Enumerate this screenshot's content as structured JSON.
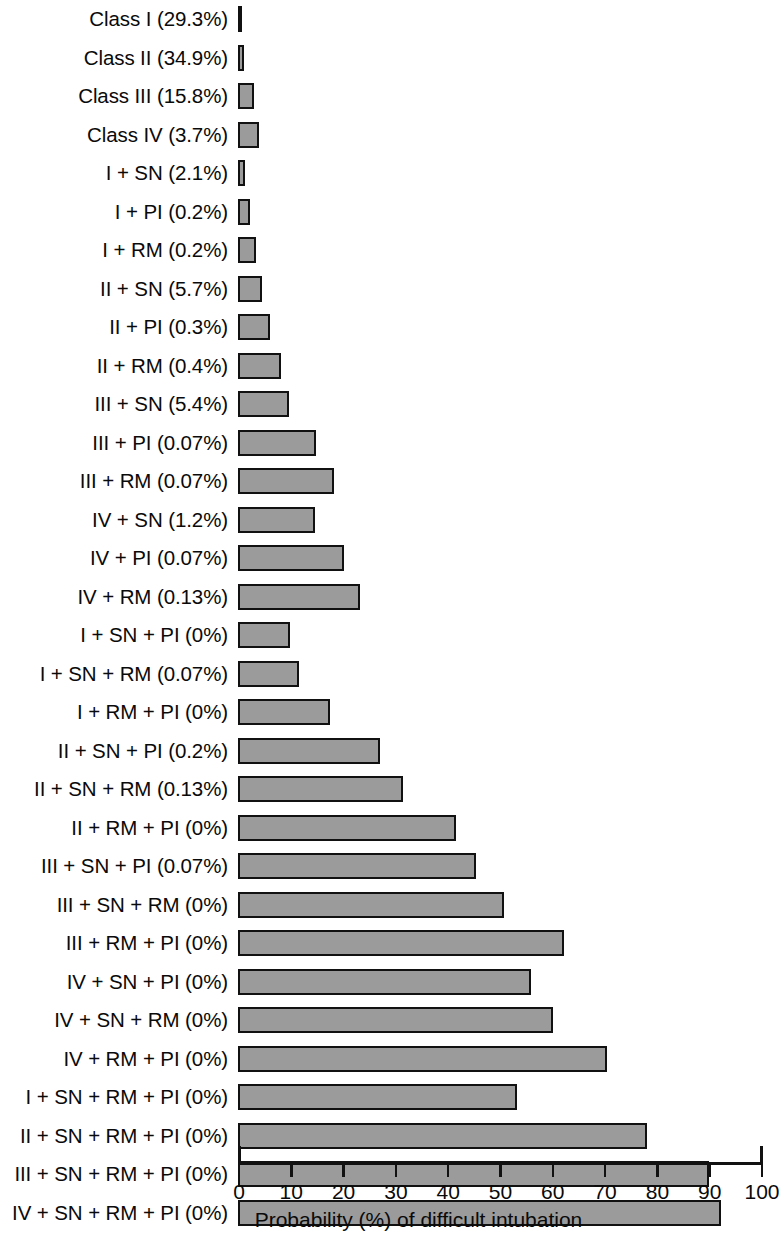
{
  "chart_data": {
    "type": "bar",
    "orientation": "horizontal",
    "title": "",
    "xlabel": "Probability (%) of difficult intubation",
    "ylabel": "",
    "xlim": [
      0,
      100
    ],
    "xticks": [
      0,
      10,
      20,
      30,
      40,
      50,
      60,
      70,
      80,
      90,
      100
    ],
    "xticklabels": [
      "0",
      "10",
      "20",
      "30",
      "40",
      "50",
      "60",
      "70",
      "80",
      "90",
      "100"
    ],
    "grid": false,
    "legend": null,
    "bar_color": "#9b9b9b",
    "bar_edge_color": "#111111",
    "categories": [
      "Class I (29.3%)",
      "Class II (34.9%)",
      "Class III (15.8%)",
      "Class IV (3.7%)",
      "I + SN (2.1%)",
      "I + PI (0.2%)",
      "I + RM (0.2%)",
      "II + SN (5.7%)",
      "II + PI (0.3%)",
      "II + RM (0.4%)",
      "III + SN (5.4%)",
      "III + PI (0.07%)",
      "III + RM (0.07%)",
      "IV + SN (1.2%)",
      "IV + PI (0.07%)",
      "IV + RM (0.13%)",
      "I + SN + PI (0%)",
      "I + SN + RM (0.07%)",
      "I + RM + PI (0%)",
      "II + SN + PI (0.2%)",
      "II + SN + RM (0.13%)",
      "II + RM + PI (0%)",
      "III + SN + PI (0.07%)",
      "III + SN + RM (0%)",
      "III + RM + PI (0%)",
      "IV + SN + PI (0%)",
      "IV + SN + RM (0%)",
      "IV + RM + PI (0%)",
      "I + SN + RM + PI (0%)",
      "II + SN + RM + PI (0%)",
      "III + SN + RM + PI (0%)",
      "IV + SN + RM + PI (0%)"
    ],
    "values": [
      0.8,
      1.1,
      3.0,
      4.0,
      1.3,
      2.2,
      3.4,
      4.6,
      6.1,
      8.2,
      9.7,
      15.0,
      18.3,
      14.8,
      20.2,
      23.3,
      9.9,
      11.7,
      17.6,
      27.2,
      31.5,
      41.6,
      45.6,
      50.9,
      62.3,
      56.1,
      60.3,
      70.6,
      53.3,
      78.2,
      90.0,
      92.3
    ]
  },
  "figure": {
    "axis_title": "Probability (%) of difficult intubation"
  }
}
